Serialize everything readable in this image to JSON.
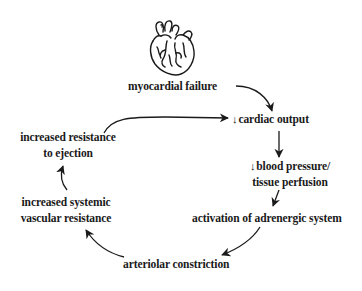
{
  "diagram": {
    "type": "cycle",
    "icon": "heart-icon",
    "nodes": {
      "myocardial_failure": "myocardial failure",
      "cardiac_output": "cardiac output",
      "blood_pressure_line1": "blood pressure/",
      "blood_pressure_line2": "tissue perfusion",
      "adrenergic": "activation of adrenergic system",
      "arteriolar": "arteriolar constriction",
      "svr_line1": "increased systemic",
      "svr_line2": "vascular resistance",
      "ejection_line1": "increased resistance",
      "ejection_line2": "to ejection"
    },
    "decrease_symbol": "↓",
    "edges": [
      [
        "myocardial failure",
        "cardiac output"
      ],
      [
        "cardiac output",
        "blood pressure/tissue perfusion"
      ],
      [
        "blood pressure/tissue perfusion",
        "activation of adrenergic system"
      ],
      [
        "activation of adrenergic system",
        "arteriolar constriction"
      ],
      [
        "arteriolar constriction",
        "increased systemic vascular resistance"
      ],
      [
        "increased systemic vascular resistance",
        "increased resistance to ejection"
      ],
      [
        "increased resistance to ejection",
        "cardiac output"
      ]
    ],
    "colors": {
      "ink": "#1a1a1a",
      "background": "#ffffff"
    }
  }
}
